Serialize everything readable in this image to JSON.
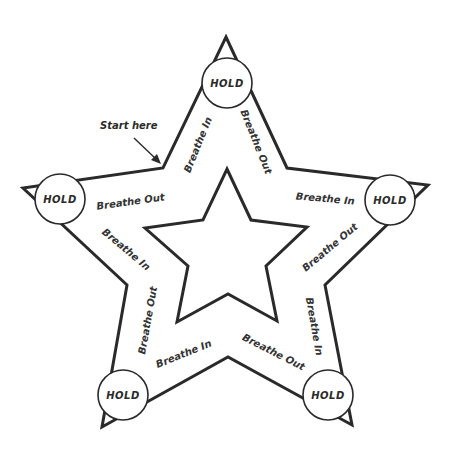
{
  "diagram": {
    "start_label": "Start here",
    "hold_label": "HOLD",
    "colors": {
      "stroke": "#2a2a2a",
      "text": "#333333",
      "background": "#ffffff"
    },
    "holds": [
      {
        "position": "top",
        "label": "HOLD"
      },
      {
        "position": "left",
        "label": "HOLD"
      },
      {
        "position": "right",
        "label": "HOLD"
      },
      {
        "position": "bottom-left",
        "label": "HOLD"
      },
      {
        "position": "bottom-right",
        "label": "HOLD"
      }
    ],
    "steps": [
      {
        "edge": "upper-left-rising",
        "label": "Breathe In"
      },
      {
        "edge": "upper-right-falling",
        "label": "Breathe Out"
      },
      {
        "edge": "right-arm-top",
        "label": "Breathe In"
      },
      {
        "edge": "right-arm-bottom",
        "label": "Breathe Out"
      },
      {
        "edge": "right-lower-vertical",
        "label": "Breathe In"
      },
      {
        "edge": "bottom-right",
        "label": "Breathe Out"
      },
      {
        "edge": "bottom-left",
        "label": "Breathe In"
      },
      {
        "edge": "left-lower-vertical",
        "label": "Breathe Out"
      },
      {
        "edge": "left-arm-bottom",
        "label": "Breathe In"
      },
      {
        "edge": "left-arm-top",
        "label": "Breathe Out"
      }
    ]
  }
}
